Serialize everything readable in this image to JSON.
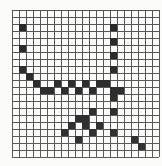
{
  "chart_data": {
    "type": "scatter",
    "title": "",
    "subtitle": "",
    "xlabel": "",
    "ylabel": "",
    "xlim": [
      0,
      20
    ],
    "ylim": [
      0,
      20
    ],
    "grid": true,
    "grid_color": "#4a4a4a",
    "background_color": "#fbfbfa",
    "marker_color": "#1c1c1c",
    "marker_shape": "square",
    "marker_size_px": 7,
    "legend": null,
    "legend_position": "none",
    "xticks": [
      0,
      1,
      2,
      3,
      4,
      5,
      6,
      7,
      8,
      9,
      10,
      11,
      12,
      13,
      14,
      15,
      16,
      17,
      18,
      19,
      20
    ],
    "yticks": [
      0,
      1,
      2,
      3,
      4,
      5,
      6,
      7,
      8,
      9,
      10,
      11,
      12,
      13,
      14,
      15,
      16,
      17,
      18,
      19,
      20
    ],
    "xtick_labels": [],
    "ytick_labels": [],
    "n_columns": 21,
    "n_rows": 21,
    "points": [
      {
        "x": 1,
        "y": 2
      },
      {
        "x": 1,
        "y": 5
      },
      {
        "x": 1,
        "y": 8
      },
      {
        "x": 2,
        "y": 9
      },
      {
        "x": 3,
        "y": 10
      },
      {
        "x": 4,
        "y": 11
      },
      {
        "x": 5,
        "y": 11
      },
      {
        "x": 6,
        "y": 10
      },
      {
        "x": 7,
        "y": 11
      },
      {
        "x": 8,
        "y": 10
      },
      {
        "x": 9,
        "y": 11
      },
      {
        "x": 10,
        "y": 10
      },
      {
        "x": 11,
        "y": 11
      },
      {
        "x": 12,
        "y": 10
      },
      {
        "x": 13,
        "y": 10
      },
      {
        "x": 14,
        "y": 11
      },
      {
        "x": 15,
        "y": 11
      },
      {
        "x": 14,
        "y": 2
      },
      {
        "x": 14,
        "y": 4
      },
      {
        "x": 14,
        "y": 6
      },
      {
        "x": 14,
        "y": 8
      },
      {
        "x": 14,
        "y": 12
      },
      {
        "x": 14,
        "y": 14
      },
      {
        "x": 9,
        "y": 15
      },
      {
        "x": 10,
        "y": 15
      },
      {
        "x": 11,
        "y": 14
      },
      {
        "x": 8,
        "y": 16
      },
      {
        "x": 10,
        "y": 16
      },
      {
        "x": 12,
        "y": 16
      },
      {
        "x": 7,
        "y": 17
      },
      {
        "x": 11,
        "y": 17
      },
      {
        "x": 14,
        "y": 17
      },
      {
        "x": 9,
        "y": 18
      },
      {
        "x": 17,
        "y": 18
      },
      {
        "x": 18,
        "y": 19
      }
    ]
  },
  "figure": {
    "width_px": 162,
    "height_px": 166,
    "plot_left_px": 12,
    "plot_top_px": 10,
    "plot_width_px": 140,
    "plot_height_px": 147,
    "cell_px": 7
  }
}
